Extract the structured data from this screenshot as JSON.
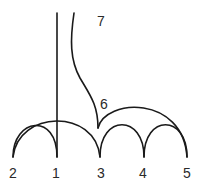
{
  "diagram": {
    "type": "arc-diagram",
    "stroke_color": "#1a1a1a",
    "label_color": "#2a2a2a",
    "nodes": [
      {
        "id": "2",
        "label": "2"
      },
      {
        "id": "1",
        "label": "1"
      },
      {
        "id": "3",
        "label": "3"
      },
      {
        "id": "4",
        "label": "4"
      },
      {
        "id": "5",
        "label": "5"
      },
      {
        "id": "6",
        "label": "6"
      },
      {
        "id": "7",
        "label": "7"
      }
    ],
    "edges": [
      {
        "from": "2",
        "to": "1",
        "shape": "arc"
      },
      {
        "from": "2",
        "to": "3",
        "shape": "arc"
      },
      {
        "from": "3",
        "to": "4",
        "shape": "arc"
      },
      {
        "from": "4",
        "to": "5",
        "shape": "arc"
      },
      {
        "from": "6",
        "to": "5",
        "shape": "arc"
      },
      {
        "from": "7",
        "to": "6",
        "shape": "curve"
      },
      {
        "from": "1",
        "to": "top",
        "shape": "vertical-line"
      }
    ]
  }
}
